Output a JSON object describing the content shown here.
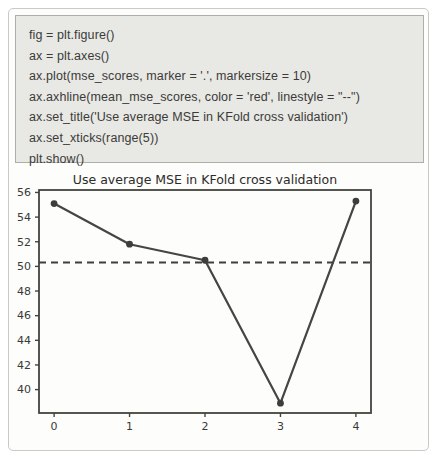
{
  "code_block": {
    "lines": [
      "fig = plt.figure()",
      "ax = plt.axes()",
      "ax.plot(mse_scores, marker = '.', markersize = 10)",
      "ax.axhline(mean_mse_scores, color = 'red', linestyle = \"--\")",
      "ax.set_title('Use average MSE in KFold cross validation')",
      "ax.set_xticks(range(5))",
      "plt.show()"
    ]
  },
  "chart_data": {
    "type": "line",
    "title": "Use average MSE in KFold cross validation",
    "series_name": "mse_scores",
    "x": [
      0,
      1,
      2,
      3,
      4
    ],
    "values": [
      55.1,
      51.8,
      50.5,
      38.9,
      55.3
    ],
    "mean_line": 50.32,
    "xticks": [
      0,
      1,
      2,
      3,
      4
    ],
    "yticks": [
      40,
      42,
      44,
      46,
      48,
      50,
      52,
      54,
      56
    ],
    "xlim": [
      -0.2,
      4.2
    ],
    "ylim": [
      38.1,
      56.2
    ],
    "grid": false,
    "legend": "none",
    "marker": "point",
    "line_color": "#454543",
    "marker_color": "#3d3d3b",
    "mean_line_color": "#3f3f3d",
    "mean_line_style": "dashed",
    "spine_color": "#44443f",
    "tick_label_color": "#3a3a38"
  },
  "colors": {
    "page_background": "#ffffff",
    "frame_border": "#c9c9c5",
    "code_background": "#e8e8e4",
    "code_border": "#aeaeaa",
    "code_text": "#3b3b39"
  }
}
